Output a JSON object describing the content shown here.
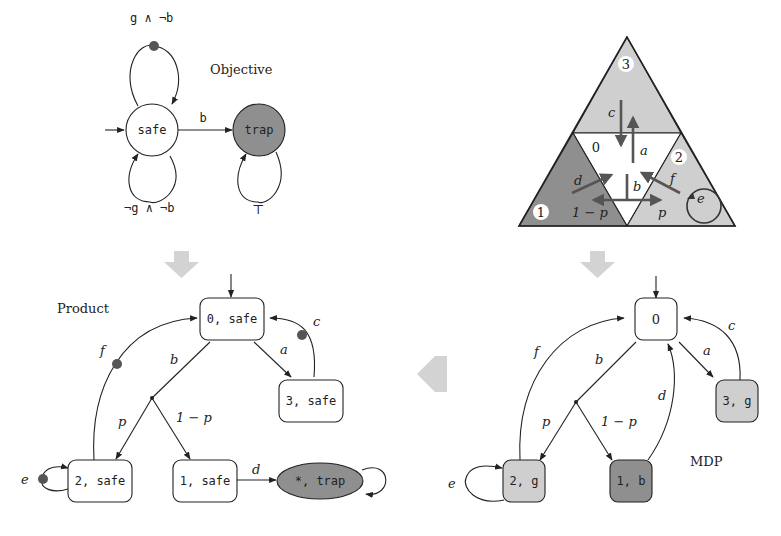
{
  "objective": {
    "title": "Objective",
    "states": [
      {
        "id": "safe",
        "label": "safe",
        "fill": "#ffffff",
        "initial": true
      },
      {
        "id": "trap",
        "label": "trap",
        "fill": "#8f8f8f"
      }
    ],
    "edges": [
      {
        "from": "safe",
        "to": "safe",
        "label": "g ∧ ¬b",
        "marked": true
      },
      {
        "from": "safe",
        "to": "safe",
        "label": "¬g ∧ ¬b"
      },
      {
        "from": "safe",
        "to": "trap",
        "label": "b"
      },
      {
        "from": "trap",
        "to": "trap",
        "label": "⊤"
      }
    ]
  },
  "gridworld": {
    "cells": [
      {
        "id": "3",
        "label": "3",
        "fill": "#cfcfcf"
      },
      {
        "id": "0",
        "label": "0",
        "fill": "#ffffff"
      },
      {
        "id": "1",
        "label": "1",
        "fill": "#8f8f8f"
      },
      {
        "id": "2",
        "label": "2",
        "fill": "#cfcfcf"
      }
    ],
    "actions": {
      "a": "a",
      "b": "b",
      "c": "c",
      "d": "d",
      "e": "e",
      "f": "f"
    },
    "probs": {
      "p": "p",
      "one_minus_p": "1 − p"
    }
  },
  "mdp": {
    "title": "MDP",
    "states": [
      {
        "id": "0",
        "label": "0",
        "fill": "#ffffff",
        "initial": true
      },
      {
        "id": "3g",
        "label": "3, g",
        "fill": "#cfcfcf"
      },
      {
        "id": "2g",
        "label": "2, g",
        "fill": "#cfcfcf"
      },
      {
        "id": "1b",
        "label": "1, b",
        "fill": "#8f8f8f"
      }
    ],
    "edge_labels": {
      "a": "a",
      "b": "b",
      "c": "c",
      "d": "d",
      "e": "e",
      "f": "f",
      "p": "p",
      "one_minus_p": "1 − p"
    }
  },
  "product": {
    "title": "Product",
    "states": [
      {
        "id": "0safe",
        "label": "0, safe",
        "fill": "#ffffff",
        "initial": true
      },
      {
        "id": "3safe",
        "label": "3, safe",
        "fill": "#ffffff"
      },
      {
        "id": "2safe",
        "label": "2, safe",
        "fill": "#ffffff"
      },
      {
        "id": "1safe",
        "label": "1, safe",
        "fill": "#ffffff"
      },
      {
        "id": "trap",
        "label": "*, trap",
        "fill": "#8f8f8f"
      }
    ],
    "edge_labels": {
      "a": "a",
      "b": "b",
      "c": "c",
      "d": "d",
      "e": "e",
      "f": "f",
      "p": "p",
      "one_minus_p": "1 − p"
    }
  },
  "colors": {
    "stroke": "#222222",
    "light_fill": "#cfcfcf",
    "dark_fill": "#8f8f8f",
    "marker_dot": "#555555",
    "flow_arrow": "#d3d3d3"
  }
}
